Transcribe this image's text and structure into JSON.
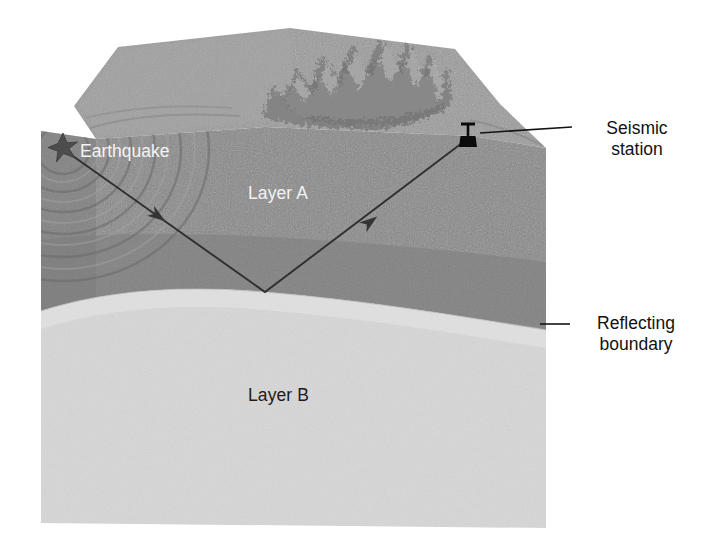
{
  "figure": {
    "type": "geology-cross-section-diagram",
    "background_color": "#ffffff",
    "width": 701,
    "height": 557
  },
  "layers": [
    {
      "id": "top-surface",
      "name": "Ground surface",
      "color": "#969696",
      "feature": "mountain-range-ridge"
    },
    {
      "id": "layer-a",
      "name": "Layer A",
      "label": "Layer A",
      "label_color": "#f2f2f2",
      "color": "#8a8a8a"
    },
    {
      "id": "layer-b",
      "name": "Layer B",
      "label": "Layer B",
      "label_color": "#1c1c1c",
      "color": "#d5d5d5"
    }
  ],
  "annotations": {
    "earthquake": {
      "label": "Earthquake",
      "label_color": "#f4f4f4",
      "marker": "star-icon",
      "marker_color": "#4a4a4a",
      "x": 63,
      "y": 148
    },
    "seismic_station": {
      "label": "Seismic\nstation",
      "label_color": "#111111",
      "marker": "seismometer-icon",
      "marker_color": "#0a0a0a",
      "x": 468,
      "y": 138,
      "leader_from_x": 480,
      "leader_from_y": 134,
      "leader_to_x": 572,
      "leader_to_y": 128
    },
    "reflecting_boundary": {
      "label": "Reflecting\nboundary",
      "label_color": "#111111",
      "leader_from_x": 540,
      "leader_from_y": 324,
      "leader_to_x": 570,
      "leader_to_y": 324
    }
  },
  "ray_path": {
    "name": "seismic-ray-reflection-path",
    "color": "#2b2b2b",
    "stroke_width": 1.8,
    "points": [
      {
        "x": 70,
        "y": 154,
        "role": "earthquake-source"
      },
      {
        "x": 265,
        "y": 292,
        "role": "reflection-point"
      },
      {
        "x": 466,
        "y": 140,
        "role": "seismic-station"
      }
    ],
    "arrowheads": [
      {
        "x": 158,
        "y": 216,
        "direction": "down-right",
        "name": "downgoing-ray-arrow"
      },
      {
        "x": 370,
        "y": 222,
        "direction": "up-right",
        "name": "upgoing-ray-arrow"
      }
    ]
  },
  "wavefronts": {
    "name": "earthquake-wavefront-rings",
    "count": 6,
    "color": "#6e6e6e",
    "origin_x": 63,
    "origin_y": 150
  }
}
